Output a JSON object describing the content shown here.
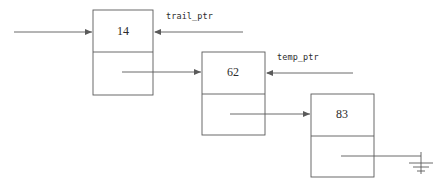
{
  "diagram": {
    "type": "linked-list",
    "background_color": "#ffffff",
    "stroke_color": "#5a5a5a",
    "text_color": "#2b2b2b",
    "nodes": [
      {
        "id": "node-1",
        "value": "14",
        "x": 93,
        "y": 10,
        "width": 60,
        "height": 85,
        "divider_y": 52,
        "value_cx": 123,
        "value_cy": 32
      },
      {
        "id": "node-2",
        "value": "62",
        "x": 202,
        "y": 52,
        "width": 63,
        "height": 83,
        "divider_y": 94,
        "value_cx": 233,
        "value_cy": 73
      },
      {
        "id": "node-3",
        "value": "83",
        "x": 311,
        "y": 94,
        "width": 63,
        "height": 83,
        "divider_y": 136,
        "value_cx": 342,
        "value_cy": 115
      }
    ],
    "pointer_labels": [
      {
        "id": "trail-ptr",
        "text": "trail_ptr",
        "text_x": 166,
        "text_y": 16,
        "arrow_from_x": 243,
        "arrow_to_x": 154,
        "arrow_y": 32
      },
      {
        "id": "temp-ptr",
        "text": "temp_ptr",
        "text_x": 277,
        "text_y": 57,
        "arrow_from_x": 353,
        "arrow_to_x": 266,
        "arrow_y": 73
      }
    ],
    "links": [
      {
        "id": "head-arrow",
        "from_x": 14,
        "to_x": 92,
        "y": 32
      },
      {
        "id": "node1-to-node2-arrow",
        "from_x": 122,
        "to_x": 201,
        "y": 72
      },
      {
        "id": "node2-to-node3-arrow",
        "from_x": 230,
        "to_x": 310,
        "y": 114
      }
    ],
    "terminator": {
      "id": "null-ground",
      "kind": "ground-symbol",
      "line_from_x": 341,
      "line_to_x": 421,
      "line_y": 156,
      "bars": [
        {
          "half_width": 12,
          "y": 163
        },
        {
          "half_width": 8,
          "y": 167
        },
        {
          "half_width": 4,
          "y": 171
        }
      ],
      "stem_x": 421,
      "stem_from_y": 152,
      "stem_to_y": 174
    }
  }
}
